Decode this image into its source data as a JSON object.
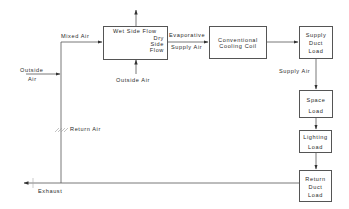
{
  "diagram": {
    "type": "HVAC airflow schematic",
    "nodes": {
      "evaporative_cooler": {
        "wet_label": "Wet Side Flow",
        "dry_label_1": "Dry",
        "dry_label_2": "Side",
        "dry_label_3": "Flow"
      },
      "cooling_coil": {
        "line1": "Conventional",
        "line2": "Cooling Coil"
      },
      "supply_duct_load": {
        "line1": "Supply",
        "line2": "Duct",
        "line3": "Load"
      },
      "space_load": {
        "line1": "Space",
        "line2": "Load"
      },
      "lighting_load": {
        "line1": "Lighting",
        "line2": "Load"
      },
      "return_duct_load": {
        "line1": "Return",
        "line2": "Duct",
        "line3": "Load"
      }
    },
    "labels": {
      "mixed_air": "Mixed Air",
      "outside_air_left_1": "Outside",
      "outside_air_left_2": "Air",
      "outside_air_bottom": "Outside Air",
      "evaporative_1": "Evaporative",
      "evaporative_2": "Supply Air",
      "supply_air": "Supply Air",
      "return_air": "Return Air",
      "exhaust": "Exhaust"
    },
    "edges": [
      {
        "from": "outside_air",
        "to": "mixed_air_junction"
      },
      {
        "from": "return_air",
        "to": "mixed_air_junction"
      },
      {
        "from": "mixed_air_junction",
        "to": "evaporative_cooler",
        "label": "Mixed Air"
      },
      {
        "from": "outside_air",
        "to": "evaporative_cooler_wet_side",
        "label": "Outside Air"
      },
      {
        "from": "evaporative_cooler_wet_side",
        "to": "exhaust_up"
      },
      {
        "from": "evaporative_cooler",
        "to": "cooling_coil",
        "label": "Evaporative Supply Air"
      },
      {
        "from": "cooling_coil",
        "to": "supply_duct_load"
      },
      {
        "from": "supply_duct_load",
        "to": "space_load",
        "label": "Supply Air"
      },
      {
        "from": "space_load",
        "to": "lighting_load"
      },
      {
        "from": "lighting_load",
        "to": "return_duct_load"
      },
      {
        "from": "return_duct_load",
        "to": "exhaust",
        "label": "Exhaust"
      }
    ]
  }
}
